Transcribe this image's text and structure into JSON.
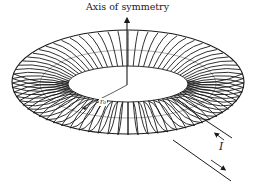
{
  "diagram": {
    "labels": {
      "axis": "Axis of symmetry",
      "radius": "r₀",
      "current": "I"
    },
    "elements": [
      "axis-of-symmetry-arrow",
      "toroidal-coil-windings",
      "radius-indicator-line",
      "lead-wire-in",
      "lead-wire-out",
      "current-arrow-in",
      "current-arrow-out"
    ],
    "colors": {
      "ink": "#1a1a1a",
      "background": "#ffffff"
    }
  }
}
